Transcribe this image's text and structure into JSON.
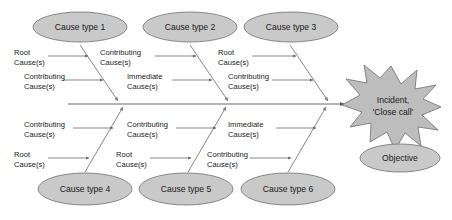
{
  "diagram": {
    "type": "fishbone-cause-and-effect",
    "title": "",
    "colors": {
      "shape_fill": "#c9c9c9",
      "shape_stroke": "#6e6e6e",
      "starburst_fill": "#bdbdbd",
      "line": "#7a7a7a",
      "text": "#1a1a1a",
      "background": "#ffffff"
    },
    "effect": {
      "shape": "starburst",
      "label_line_1": "Incident,",
      "label_line_2": "'Close call'"
    },
    "objective": {
      "shape": "ellipse",
      "label": "Objective"
    },
    "categories_top": [
      {
        "label": "Cause type 1"
      },
      {
        "label": "Cause type 2"
      },
      {
        "label": "Cause type 3"
      }
    ],
    "categories_bottom": [
      {
        "label": "Cause type 4"
      },
      {
        "label": "Cause type 5"
      },
      {
        "label": "Cause type 6"
      }
    ],
    "cause_labels": {
      "top_branch_1": [
        {
          "line1": "Root",
          "line2": "Cause(s)"
        },
        {
          "line1": "Contributing",
          "line2": "Cause(s)"
        }
      ],
      "top_branch_2": [
        {
          "line1": "Contributing",
          "line2": "Cause(s)"
        },
        {
          "line1": "Immediate",
          "line2": "Cause(s)"
        }
      ],
      "top_branch_3": [
        {
          "line1": "Root",
          "line2": "Cause(s)"
        },
        {
          "line1": "Contributing",
          "line2": "Cause(s)"
        }
      ],
      "bottom_branch_1": [
        {
          "line1": "Contributing",
          "line2": "Cause(s)"
        },
        {
          "line1": "Root",
          "line2": "Cause(s)"
        }
      ],
      "bottom_branch_2": [
        {
          "line1": "Contributing",
          "line2": "Cause(s)"
        },
        {
          "line1": "Root",
          "line2": "Cause(s)"
        }
      ],
      "bottom_branch_3": [
        {
          "line1": "Immediate",
          "line2": "Cause(s)"
        },
        {
          "line1": "Contributing",
          "line2": "Cause(s)"
        }
      ]
    }
  }
}
